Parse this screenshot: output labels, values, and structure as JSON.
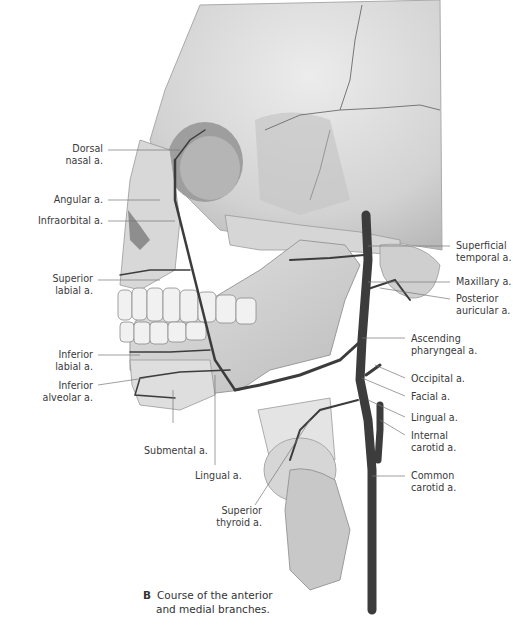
{
  "figure": {
    "panel_letter": "B",
    "caption_line1": "Course of the anterior",
    "caption_line2": "and medial branches.",
    "colors": {
      "bone": "#dcdcdc",
      "bone_shadow": "#9a9a9a",
      "artery": "#3c3c3c",
      "leader": "#777777",
      "text": "#3a3a3a"
    }
  },
  "labels_left": [
    {
      "id": "dorsal-nasal",
      "lines": [
        "Dorsal",
        "nasal a."
      ]
    },
    {
      "id": "angular",
      "lines": [
        "Angular a."
      ]
    },
    {
      "id": "infraorbital",
      "lines": [
        "Infraorbital a."
      ]
    },
    {
      "id": "superior-labial",
      "lines": [
        "Superior",
        "labial a."
      ]
    },
    {
      "id": "inferior-labial",
      "lines": [
        "Inferior",
        "labial a."
      ]
    },
    {
      "id": "inferior-alveolar",
      "lines": [
        "Inferior",
        "alveolar a."
      ]
    }
  ],
  "labels_bottom": [
    {
      "id": "submental",
      "lines": [
        "Submental a."
      ]
    },
    {
      "id": "lingual-bottom",
      "lines": [
        "Lingual a."
      ]
    },
    {
      "id": "superior-thyroid",
      "lines": [
        "Superior",
        "thyroid a."
      ]
    }
  ],
  "labels_right": [
    {
      "id": "superficial-temporal",
      "lines": [
        "Superficial",
        "temporal a."
      ]
    },
    {
      "id": "maxillary",
      "lines": [
        "Maxillary a."
      ]
    },
    {
      "id": "posterior-auricular",
      "lines": [
        "Posterior",
        "auricular a."
      ]
    },
    {
      "id": "ascending-pharyngeal",
      "lines": [
        "Ascending",
        "pharyngeal a."
      ]
    },
    {
      "id": "occipital",
      "lines": [
        "Occipital a."
      ]
    },
    {
      "id": "facial",
      "lines": [
        "Facial a."
      ]
    },
    {
      "id": "lingual-right",
      "lines": [
        "Lingual a."
      ]
    },
    {
      "id": "internal-carotid",
      "lines": [
        "Internal",
        "carotid a."
      ]
    },
    {
      "id": "common-carotid",
      "lines": [
        "Common",
        "carotid a."
      ]
    }
  ]
}
